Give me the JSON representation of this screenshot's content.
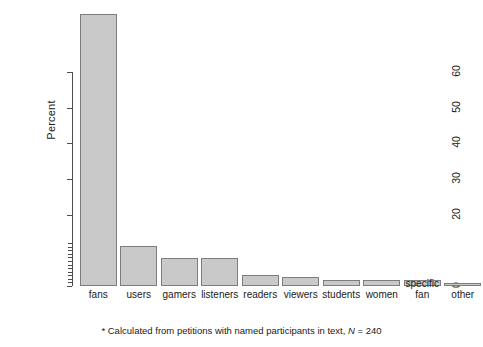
{
  "chart_data": {
    "type": "bar",
    "title": "",
    "xlabel": "",
    "ylabel": "Percent",
    "ylim": [
      0,
      76
    ],
    "grid": false,
    "legend": null,
    "categories": [
      "fans",
      "users",
      "gamers",
      "listeners",
      "readers",
      "viewers",
      "students",
      "women",
      "specific\nfan",
      "other"
    ],
    "values": [
      76.3,
      11.3,
      7.9,
      7.9,
      3.1,
      2.5,
      1.7,
      1.7,
      1.7,
      0.8
    ],
    "ytick_labels": [
      "0",
      "20",
      "30",
      "40",
      "50",
      "60"
    ],
    "ytick_values": [
      0,
      20,
      30,
      40,
      50,
      60
    ],
    "yminor_values": [
      1,
      2,
      3,
      4,
      5,
      6,
      7,
      8,
      9,
      10,
      11,
      12
    ],
    "footnote_marker": "*",
    "footnote_text": " Calculated from petitions with named participants in text, ",
    "footnote_n_label": "N",
    "footnote_n_value": " = 240",
    "bar_fill_color": "#c9c9c9",
    "bar_edge_color": "#7d7d7d",
    "axis_color": "#4d4d4d",
    "background_color": "#ffffff"
  }
}
